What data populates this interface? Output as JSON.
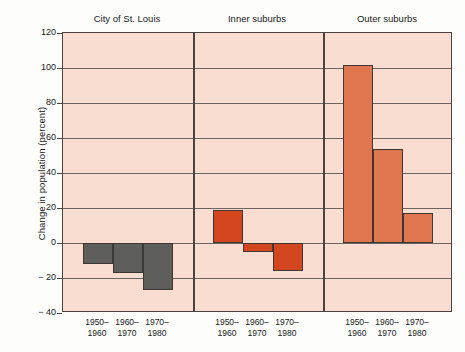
{
  "chart_data": {
    "type": "bar",
    "title": "",
    "xlabel": "",
    "ylabel": "Change in population (percent)",
    "ylim": [
      -40,
      120
    ],
    "ytick_labels": [
      "120",
      "100",
      "80",
      "60",
      "40",
      "20",
      "0",
      "− 20",
      "− 40"
    ],
    "ytick_values": [
      120,
      100,
      80,
      60,
      40,
      20,
      0,
      -20,
      -40
    ],
    "grid": true,
    "legend": "none",
    "categories": [
      "1950–1960",
      "1960–1970",
      "1970–1980"
    ],
    "category_label_lines": [
      [
        "1950–",
        "1960"
      ],
      [
        "1960–",
        "1970"
      ],
      [
        "1970–",
        "1980"
      ]
    ],
    "panels": [
      {
        "name": "city-of-st-louis",
        "title": "City of St. Louis",
        "color": "#5e5e5a",
        "values": [
          -12,
          -17,
          -27
        ]
      },
      {
        "name": "inner-suburbs",
        "title": "Inner suburbs",
        "color": "#d4461f",
        "values": [
          19,
          -5,
          -16
        ]
      },
      {
        "name": "outer-suburbs",
        "title": "Outer suburbs",
        "color": "#e0764f",
        "values": [
          102,
          54,
          17
        ]
      }
    ]
  },
  "colors": {
    "plot_background": "#f8ddd0",
    "axis": "#4a4340",
    "gridline": "#6d6460",
    "bar_city": "#5e5e5a",
    "bar_inner": "#d4461f",
    "bar_outer": "#e0764f",
    "text": "#1a1a1a"
  }
}
